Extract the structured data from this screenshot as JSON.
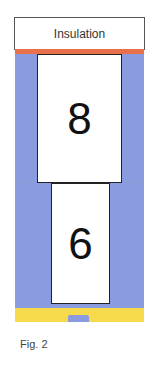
{
  "diagram": {
    "insulation_label": "Insulation",
    "upper_block_label": "8",
    "lower_block_label": "6",
    "caption": "Fig. 2",
    "colors": {
      "column": "#8b9be0",
      "heater_strip": "#e8704a",
      "base_band": "#f7d94c",
      "tab": "#8b9be0"
    }
  }
}
